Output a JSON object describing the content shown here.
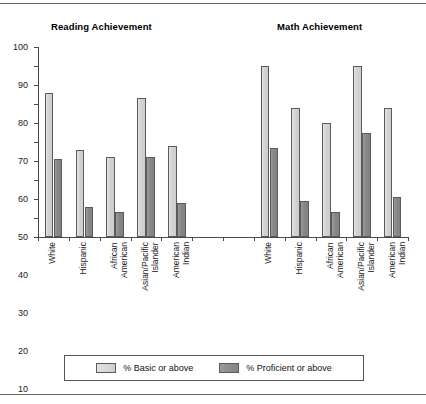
{
  "figure": {
    "panels": [
      {
        "title": "Reading Achievement"
      },
      {
        "title": "Math Achievement"
      }
    ]
  },
  "legend": {
    "entries": [
      {
        "label": "% Basic or above",
        "color": "#d2d2d2",
        "swatch": "basic-swatch"
      },
      {
        "label": "% Proficient or above",
        "color": "#878787",
        "swatch": "proficient-swatch"
      }
    ]
  },
  "axis": {
    "y_ticks": [
      "0",
      "10",
      "20",
      "30",
      "40",
      "50",
      "60",
      "70",
      "80",
      "90",
      "100"
    ]
  },
  "chart_data": {
    "type": "bar",
    "xlabel": "",
    "ylabel": "",
    "ylim": [
      0,
      100
    ],
    "ytick_step": 10,
    "grid": false,
    "legend_position": "bottom",
    "panels": [
      {
        "title": "Reading Achievement",
        "categories": [
          "White",
          "Hispanic",
          "African American",
          "Asian/Pacific Islander",
          "American Indian"
        ],
        "series": [
          {
            "name": "% Basic or above",
            "values": [
              76,
              46,
              42,
              73,
              48
            ]
          },
          {
            "name": "% Proficient or above",
            "values": [
              41,
              16,
              13,
              42,
              18
            ]
          }
        ]
      },
      {
        "title": "Math Achievement",
        "categories": [
          "White",
          "Hispanic",
          "African American",
          "Asian/Pacific Islander",
          "American Indian"
        ],
        "series": [
          {
            "name": "% Basic or above",
            "values": [
              90,
              68,
              60,
              90,
              68
            ]
          },
          {
            "name": "% Proficient or above",
            "values": [
              47,
              19,
              13,
              55,
              21
            ]
          }
        ]
      }
    ]
  }
}
